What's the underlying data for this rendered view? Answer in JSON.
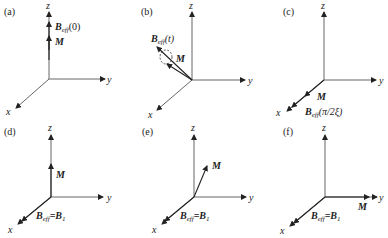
{
  "figure": {
    "axes_labels": {
      "x": "x",
      "y": "y",
      "z": "z"
    },
    "panels": [
      {
        "id": "a",
        "label": "(a)",
        "vectors": [
          {
            "name": "B_eff",
            "label_main": "B",
            "label_sub": "eff",
            "label_arg": "(0)",
            "direction": "+z"
          },
          {
            "name": "M",
            "label_main": "M",
            "direction": "+z"
          }
        ]
      },
      {
        "id": "b",
        "label": "(b)",
        "vectors": [
          {
            "name": "B_eff",
            "label_main": "B",
            "label_sub": "eff",
            "label_arg": "(t)",
            "direction": "tilted between z and x"
          },
          {
            "name": "M",
            "label_main": "M",
            "direction": "precessing about B_eff (dashed circle)"
          }
        ]
      },
      {
        "id": "c",
        "label": "(c)",
        "vectors": [
          {
            "name": "M",
            "label_main": "M",
            "direction": "+x"
          },
          {
            "name": "B_eff",
            "label_main": "B",
            "label_sub": "eff",
            "label_arg": "(π/2ξ)",
            "direction": "+x"
          }
        ]
      },
      {
        "id": "d",
        "label": "(d)",
        "vectors": [
          {
            "name": "M",
            "label_main": "M",
            "direction": "+z"
          },
          {
            "name": "B_eff",
            "label_main": "B",
            "label_sub": "eff",
            "label_eq": "=B",
            "label_eq_sub": "1",
            "direction": "+x"
          }
        ]
      },
      {
        "id": "e",
        "label": "(e)",
        "vectors": [
          {
            "name": "M",
            "label_main": "M",
            "direction": "tilted between z and y"
          },
          {
            "name": "B_eff",
            "label_main": "B",
            "label_sub": "eff",
            "label_eq": "=B",
            "label_eq_sub": "1",
            "direction": "+x"
          }
        ]
      },
      {
        "id": "f",
        "label": "(f)",
        "vectors": [
          {
            "name": "M",
            "label_main": "M",
            "direction": "+y"
          },
          {
            "name": "B_eff",
            "label_main": "B",
            "label_sub": "eff",
            "label_eq": "=B",
            "label_eq_sub": "1",
            "direction": "+x"
          }
        ]
      }
    ]
  }
}
